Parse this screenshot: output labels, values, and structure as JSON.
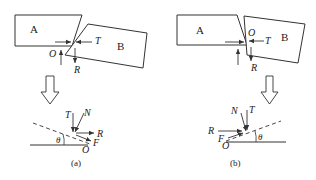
{
  "figure": {
    "panels": [
      {
        "id": "a",
        "caption": "(a)",
        "top": {
          "block_a_label": "A",
          "block_b_label": "B",
          "contact_point_label": "O",
          "force_t_label": "T",
          "force_r_label": "R"
        },
        "bottom": {
          "force_t_label": "T",
          "force_n_label": "N",
          "force_r_label": "R",
          "force_f_label": "F",
          "angle_label": "θ",
          "origin_label": "O"
        }
      },
      {
        "id": "b",
        "caption": "(b)",
        "top": {
          "block_a_label": "A",
          "block_b_label": "B",
          "contact_point_label": "O",
          "force_t_label": "T",
          "force_r_label": "R"
        },
        "bottom": {
          "force_n_label": "N",
          "force_t_label": "T",
          "force_r_label": "R",
          "force_f_label": "F",
          "angle_label": "θ",
          "origin_label": "O"
        }
      }
    ],
    "colors": {
      "stroke": "#333333",
      "background": "#ffffff"
    }
  }
}
